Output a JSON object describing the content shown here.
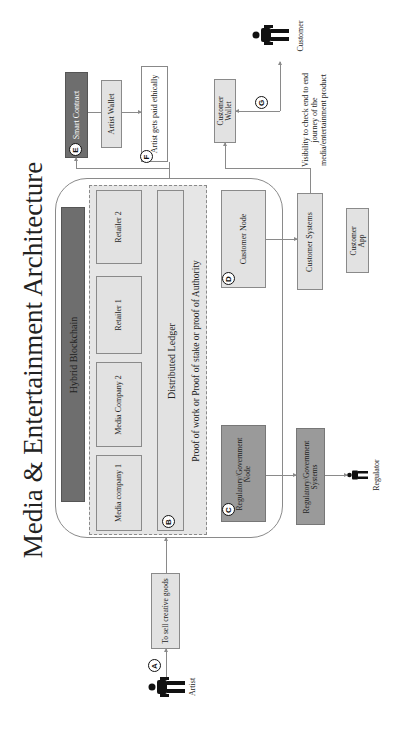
{
  "title": "Media & Entertainment Architecture",
  "blockchain": {
    "header": "Hybrid Blockchain",
    "participants": [
      "Retailer 2",
      "Retailer 1",
      "Media Company 2",
      "Media company 1"
    ],
    "ledger": "Distributed Ledger",
    "consensus": "Proof of work or Proof of stake or proof of Authority",
    "ledger_badge": "B"
  },
  "nodes": {
    "regulatory_node": {
      "label": "Regulatory/Government Node",
      "badge": "C"
    },
    "customer_node": {
      "label": "Customer Node",
      "badge": "D"
    }
  },
  "external_systems": {
    "regulatory_systems": "Regulatory/Government Systems",
    "customer_systems": "Customer Systems",
    "customer_app": "Customer App",
    "customer_wallet": "Customer Wallet"
  },
  "payments": {
    "smart_contract": {
      "label": "Smart Contract",
      "badge": "E"
    },
    "artist_wallet": "Artist Wallet",
    "artist_paid": {
      "label": "Artist gets paid ethically",
      "badge": "F"
    }
  },
  "artist_flow": {
    "step": "To sell creative goods",
    "badge": "A",
    "actor": "Artist"
  },
  "customer_flow": {
    "visibility": "Visibility to check end to end journey of the media/entertainment product",
    "badge": "G",
    "actor": "Customer"
  },
  "regulator": {
    "actor": "Regulator"
  },
  "colors": {
    "dark_box": "#6e6e6e",
    "mid_box": "#9a9a9a",
    "light_box": "#e2e2e2",
    "line": "#8a8a8a"
  }
}
